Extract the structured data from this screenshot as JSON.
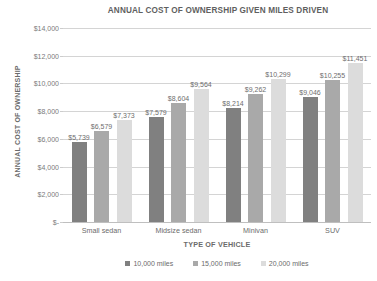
{
  "chart_data": {
    "type": "bar",
    "title": "ANNUAL COST OF OWNERSHIP GIVEN MILES DRIVEN",
    "xlabel": "TYPE OF VEHICLE",
    "ylabel": "ANNUAL COST OF OWNERSHIP",
    "categories": [
      "Small sedan",
      "Midsize sedan",
      "Minivan",
      "SUV"
    ],
    "series": [
      {
        "name": "10,000 miles",
        "color": "#808080",
        "values": [
          5739,
          7579,
          8214,
          9046
        ],
        "labels": [
          "$5,739",
          "$7,579",
          "$8,214",
          "$9,046"
        ]
      },
      {
        "name": "15,000 miles",
        "color": "#a9a9a9",
        "values": [
          6579,
          8604,
          9262,
          10255
        ],
        "labels": [
          "$6,579",
          "$8,604",
          "$9,262",
          "$10,255"
        ]
      },
      {
        "name": "20,000 miles",
        "color": "#dcdcdc",
        "values": [
          7373,
          9564,
          10299,
          11451
        ],
        "labels": [
          "$7,373",
          "$9,564",
          "$10,299",
          "$11,451"
        ]
      }
    ],
    "ylim": [
      0,
      14000
    ],
    "ytick_values": [
      14000,
      12000,
      10000,
      8000,
      6000,
      4000,
      2000,
      0
    ],
    "ytick_labels": [
      "$14,000",
      "$12,000",
      "$10,000",
      "$8,000",
      "$6,000",
      "$4,000",
      "$2,000",
      "$-"
    ],
    "grid": true,
    "legend_position": "bottom"
  }
}
